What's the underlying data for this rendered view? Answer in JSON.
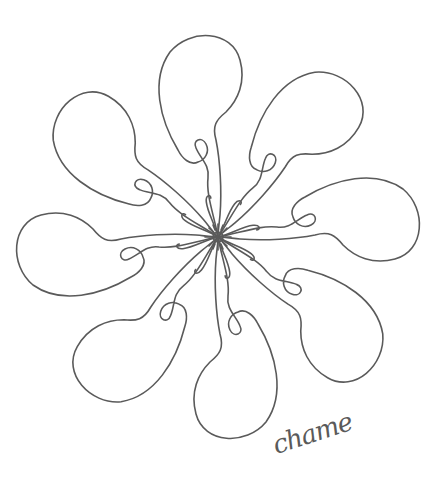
{
  "artwork": {
    "title": "Line-art pinwheel flower",
    "petal_count": 8,
    "center": [
      218,
      237
    ],
    "stroke_color": "#5a5a5a",
    "background_color": "#ffffff",
    "stroke_width": 1.6
  },
  "signature": {
    "text": "chame",
    "color": "#5a5a5a"
  }
}
